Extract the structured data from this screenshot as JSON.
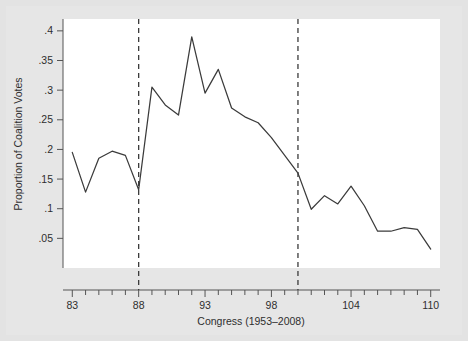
{
  "chart_data": {
    "type": "line",
    "title": "",
    "xlabel": "Congress (1953–2008)",
    "ylabel": "Proportion of Coalition Votes",
    "xlim": [
      82.3,
      110.7
    ],
    "ylim": [
      0.0,
      0.42
    ],
    "grid": false,
    "legend": null,
    "x_tick_labels": [
      "83",
      "88",
      "93",
      "98",
      "104",
      "110"
    ],
    "x_tick_values": [
      83,
      88,
      93,
      98,
      104,
      110
    ],
    "x_minor_ticks_every": 1,
    "y_tick_labels": [
      ".05",
      ".1",
      ".15",
      ".2",
      ".25",
      ".3",
      ".35",
      ".4"
    ],
    "y_tick_values": [
      0.05,
      0.1,
      0.15,
      0.2,
      0.25,
      0.3,
      0.35,
      0.4
    ],
    "x": [
      83,
      84,
      85,
      86,
      87,
      88,
      89,
      90,
      91,
      92,
      93,
      94,
      95,
      96,
      97,
      98,
      99,
      100,
      101,
      102,
      103,
      104,
      105,
      106,
      107,
      108,
      109,
      110
    ],
    "values": [
      0.195,
      0.128,
      0.185,
      0.197,
      0.19,
      0.132,
      0.305,
      0.275,
      0.258,
      0.39,
      0.295,
      0.335,
      0.27,
      0.255,
      0.245,
      0.22,
      0.19,
      0.16,
      0.099,
      0.122,
      0.108,
      0.138,
      0.105,
      0.062,
      0.062,
      0.068,
      0.065,
      0.032
    ],
    "series": [
      {
        "name": "Proportion of Coalition Votes",
        "values": [
          0.195,
          0.128,
          0.185,
          0.197,
          0.19,
          0.132,
          0.305,
          0.275,
          0.258,
          0.39,
          0.295,
          0.335,
          0.27,
          0.255,
          0.245,
          0.22,
          0.19,
          0.16,
          0.099,
          0.122,
          0.108,
          0.138,
          0.105,
          0.062,
          0.062,
          0.068,
          0.065,
          0.032
        ],
        "color": "#3b3b3b"
      }
    ],
    "annotations": [
      {
        "type": "vline",
        "label": "reference-line-88",
        "x": 88,
        "style": "dashed",
        "color": "#3b3b3b"
      },
      {
        "type": "vline",
        "label": "reference-line-100",
        "x": 100,
        "style": "dashed",
        "color": "#3b3b3b"
      }
    ]
  },
  "figure": {
    "background_color": "#e3e3e3",
    "plot_background_color": "#ffffff",
    "line_color": "#3b3b3b",
    "axis_color": "#555555",
    "text_color": "#2e2e2e"
  }
}
